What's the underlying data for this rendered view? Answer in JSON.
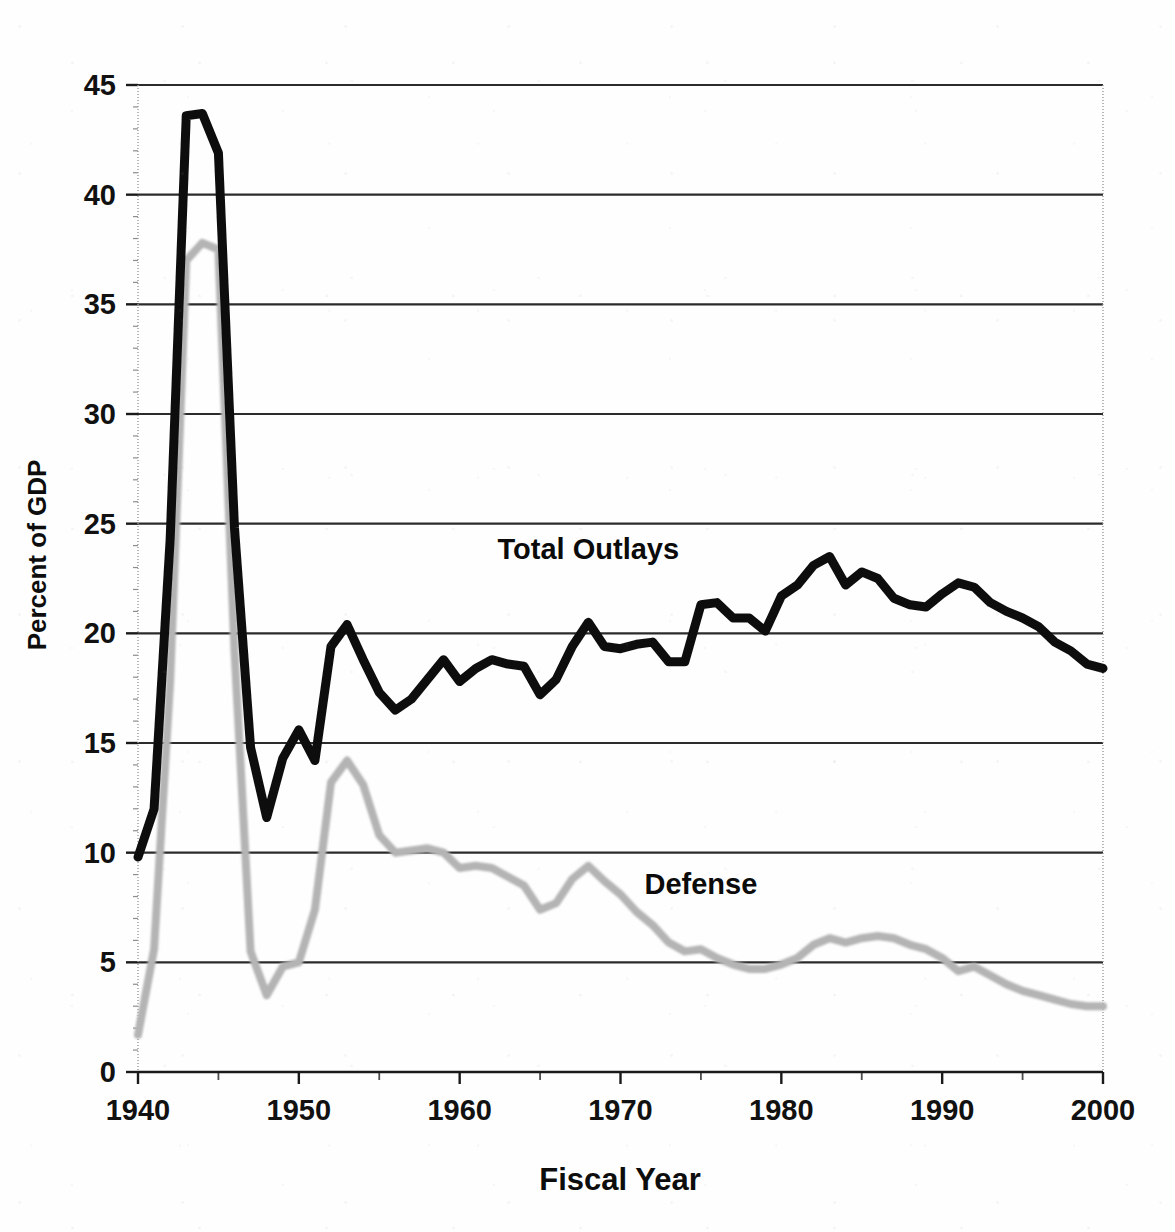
{
  "chart_data": {
    "type": "line",
    "title": "",
    "xlabel": "Fiscal Year",
    "ylabel": "Percent of GDP",
    "xlim": [
      1940,
      2000
    ],
    "ylim": [
      0,
      45
    ],
    "grid": true,
    "legend_position": "inline-annotation",
    "x_ticks": [
      "1940",
      "1950",
      "1960",
      "1970",
      "1980",
      "1990",
      "2000"
    ],
    "y_ticks": [
      "0",
      "5",
      "10",
      "15",
      "20",
      "25",
      "30",
      "35",
      "40",
      "45"
    ],
    "x": [
      1940,
      1941,
      1942,
      1943,
      1944,
      1945,
      1946,
      1947,
      1948,
      1949,
      1950,
      1951,
      1952,
      1953,
      1954,
      1955,
      1956,
      1957,
      1958,
      1959,
      1960,
      1961,
      1962,
      1963,
      1964,
      1965,
      1966,
      1967,
      1968,
      1969,
      1970,
      1971,
      1972,
      1973,
      1974,
      1975,
      1976,
      1977,
      1978,
      1979,
      1980,
      1981,
      1982,
      1983,
      1984,
      1985,
      1986,
      1987,
      1988,
      1989,
      1990,
      1991,
      1992,
      1993,
      1994,
      1995,
      1996,
      1997,
      1998,
      1999,
      2000
    ],
    "series": [
      {
        "name": "Total Outlays",
        "color": "#111111",
        "values": [
          9.8,
          12.0,
          24.3,
          43.6,
          43.7,
          41.9,
          24.8,
          14.8,
          11.6,
          14.3,
          15.6,
          14.2,
          19.4,
          20.4,
          18.8,
          17.3,
          16.5,
          17.0,
          17.9,
          18.8,
          17.8,
          18.4,
          18.8,
          18.6,
          18.5,
          17.2,
          17.9,
          19.4,
          20.5,
          19.4,
          19.3,
          19.5,
          19.6,
          18.7,
          18.7,
          21.3,
          21.4,
          20.7,
          20.7,
          20.1,
          21.7,
          22.2,
          23.1,
          23.5,
          22.2,
          22.8,
          22.5,
          21.6,
          21.3,
          21.2,
          21.8,
          22.3,
          22.1,
          21.4,
          21.0,
          20.7,
          20.3,
          19.6,
          19.2,
          18.6,
          18.4
        ]
      },
      {
        "name": "Defense",
        "color": "#b4b4b4",
        "values": [
          1.7,
          5.6,
          17.8,
          37.0,
          37.8,
          37.5,
          19.2,
          5.5,
          3.5,
          4.8,
          5.0,
          7.4,
          13.2,
          14.2,
          13.1,
          10.8,
          10.0,
          10.1,
          10.2,
          10.0,
          9.3,
          9.4,
          9.3,
          8.9,
          8.5,
          7.4,
          7.7,
          8.8,
          9.4,
          8.7,
          8.1,
          7.3,
          6.7,
          5.9,
          5.5,
          5.6,
          5.2,
          4.9,
          4.7,
          4.7,
          4.9,
          5.2,
          5.8,
          6.1,
          5.9,
          6.1,
          6.2,
          6.1,
          5.8,
          5.6,
          5.2,
          4.6,
          4.8,
          4.4,
          4.0,
          3.7,
          3.5,
          3.3,
          3.1,
          3.0,
          3.0
        ]
      }
    ],
    "annotations": [
      {
        "text": "Total Outlays",
        "x": 1968,
        "y": 23.4
      },
      {
        "text": "Defense",
        "x": 1975,
        "y": 8.1
      }
    ]
  },
  "axes": {
    "y_title": "Percent of GDP",
    "x_title": "Fiscal Year"
  }
}
